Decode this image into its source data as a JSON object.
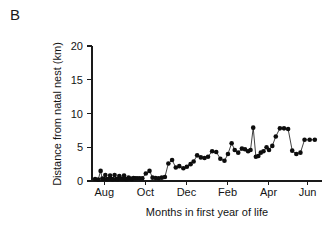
{
  "panel": {
    "label": "B"
  },
  "chart_data": {
    "type": "line",
    "title": "",
    "subtitle": "",
    "xlabel": "Months in first year of life",
    "ylabel": "Distance from natal nest (km)",
    "xlim": [
      0,
      11.2
    ],
    "ylim": [
      0,
      20
    ],
    "grid": false,
    "legend": null,
    "markers": "filled-circle",
    "marker_color": "#0d0d0d",
    "line_color": "#111111",
    "yticks": [
      0,
      5,
      10,
      15,
      20
    ],
    "ytick_labels": [
      "0",
      "5",
      "10",
      "15",
      "20"
    ],
    "xticks": [
      0.6,
      2.6,
      4.6,
      6.6,
      8.6,
      10.5
    ],
    "xtick_labels": [
      "Aug",
      "Oct",
      "Dec",
      "Feb",
      "Apr",
      "Jun"
    ],
    "x": [
      0.15,
      0.3,
      0.42,
      0.5,
      0.58,
      0.65,
      0.72,
      0.8,
      0.88,
      0.95,
      1.02,
      1.1,
      1.18,
      1.25,
      1.33,
      1.4,
      1.48,
      1.56,
      1.63,
      1.7,
      1.78,
      1.86,
      1.94,
      2.02,
      2.1,
      2.2,
      2.32,
      2.45,
      2.62,
      2.8,
      2.95,
      3.1,
      3.25,
      3.4,
      3.55,
      3.72,
      3.9,
      4.08,
      4.25,
      4.45,
      4.62,
      4.8,
      4.95,
      5.12,
      5.3,
      5.48,
      5.65,
      5.85,
      6.05,
      6.25,
      6.45,
      6.62,
      6.8,
      6.95,
      7.12,
      7.3,
      7.45,
      7.6,
      7.72,
      7.85,
      7.98,
      8.1,
      8.22,
      8.35,
      8.5,
      8.62,
      8.78,
      8.95,
      9.15,
      9.35,
      9.55,
      9.75,
      9.95,
      10.15,
      10.35,
      10.6,
      10.85
    ],
    "y": [
      0.3,
      0.2,
      1.5,
      0.35,
      0.3,
      0.9,
      0.25,
      0.3,
      0.8,
      0.3,
      0.25,
      0.9,
      0.3,
      0.25,
      0.75,
      0.35,
      0.3,
      0.8,
      0.3,
      0.25,
      0.5,
      0.35,
      0.3,
      0.45,
      0.4,
      0.4,
      0.4,
      0.4,
      1.1,
      1.5,
      0.5,
      0.45,
      0.4,
      0.5,
      0.6,
      2.6,
      3.1,
      2.0,
      2.2,
      1.9,
      2.1,
      2.5,
      2.9,
      3.8,
      3.5,
      3.4,
      3.6,
      4.4,
      4.3,
      3.3,
      3.0,
      4.0,
      5.6,
      4.6,
      4.2,
      4.8,
      4.7,
      4.4,
      4.6,
      7.9,
      3.6,
      3.7,
      4.2,
      4.4,
      5.0,
      4.6,
      5.2,
      6.6,
      7.8,
      7.8,
      7.7,
      4.5,
      4.0,
      4.2,
      6.1,
      6.1,
      6.1
    ],
    "x_pixel_axis": {
      "x0": 92,
      "x1": 322,
      "units_per_px": 0.0487
    },
    "y_pixel_axis": {
      "y0": 181,
      "y1": 46
    }
  }
}
